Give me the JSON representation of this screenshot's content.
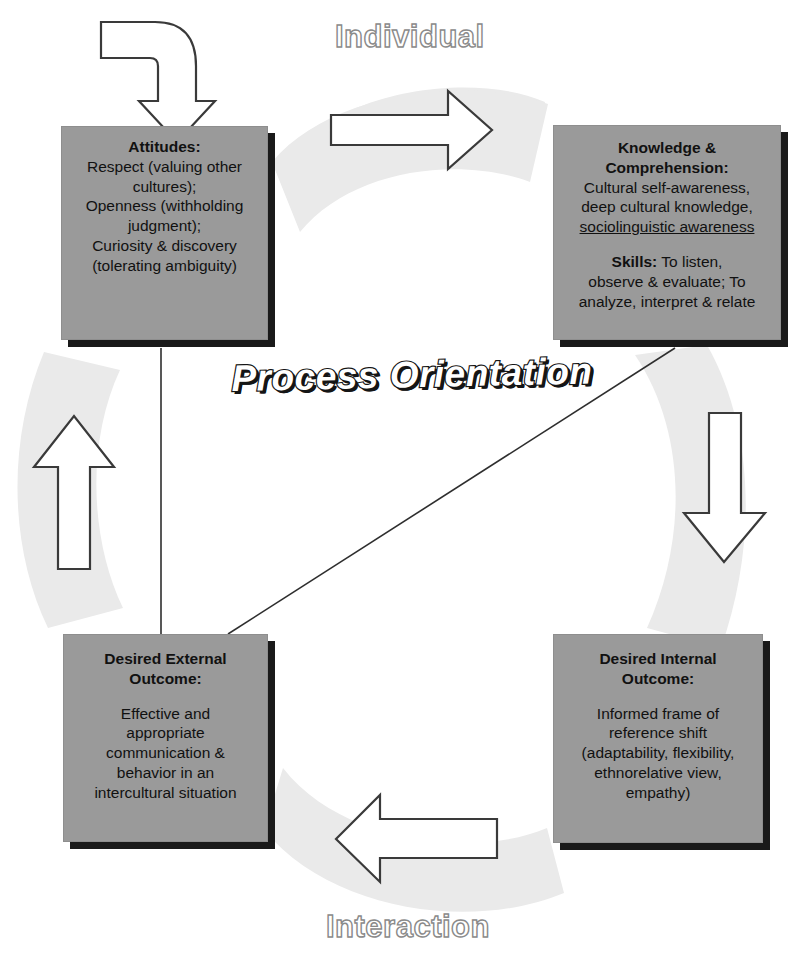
{
  "diagram": {
    "title": "Process Orientation",
    "cycle_labels": {
      "top": "Individual",
      "bottom": "Interaction"
    },
    "colors": {
      "box_fill": "#9a9a9a",
      "box_shadow": "#1a1a1a",
      "band_fill": "#eaeaea",
      "arrow_fill": "#ffffff",
      "arrow_stroke": "#3a3a3a",
      "text": "#111111",
      "title_fill": "#ffffff",
      "title_outline": "#151515",
      "label_outline": "#8a8a8a",
      "background": "#ffffff"
    },
    "nodes": [
      {
        "id": "attitudes",
        "position": "top-left",
        "lines": [
          {
            "text": "Attitudes:",
            "bold": true
          },
          {
            "text": "Respect (valuing other"
          },
          {
            "text": "cultures);"
          },
          {
            "text": "Openness (withholding"
          },
          {
            "text": "judgment);"
          },
          {
            "text": "Curiosity & discovery"
          },
          {
            "text": "(tolerating ambiguity)"
          }
        ]
      },
      {
        "id": "knowledge",
        "position": "top-right",
        "lines": [
          {
            "text": "Knowledge &",
            "bold": true
          },
          {
            "text": "Comprehension:",
            "bold": true
          },
          {
            "text": "Cultural self-awareness,"
          },
          {
            "text": "deep cultural knowledge,"
          },
          {
            "text": "sociolinguistic awareness",
            "underline": true
          },
          {
            "text": "",
            "gap": true
          },
          {
            "text": "Skills: To listen,",
            "bold_prefix": "Skills:",
            "rest": " To listen,"
          },
          {
            "text": "observe & evaluate; To"
          },
          {
            "text": "analyze, interpret & relate"
          }
        ]
      },
      {
        "id": "external",
        "position": "bottom-left",
        "lines": [
          {
            "text": "Desired External",
            "bold": true
          },
          {
            "text": "Outcome:",
            "bold": true
          },
          {
            "text": "",
            "gap": true
          },
          {
            "text": "Effective and"
          },
          {
            "text": "appropriate"
          },
          {
            "text": "communication &"
          },
          {
            "text": "behavior in an"
          },
          {
            "text": "intercultural situation"
          }
        ]
      },
      {
        "id": "internal",
        "position": "bottom-right",
        "lines": [
          {
            "text": "Desired Internal",
            "bold": true
          },
          {
            "text": "Outcome:",
            "bold": true
          },
          {
            "text": "",
            "gap": true
          },
          {
            "text": "Informed frame of"
          },
          {
            "text": "reference shift"
          },
          {
            "text": "(adaptability, flexibility,"
          },
          {
            "text": "ethnorelative view,"
          },
          {
            "text": "empathy)"
          }
        ]
      }
    ],
    "arrows": [
      {
        "id": "entry-arrow",
        "shape": "bent-down",
        "from": "outside",
        "to": "attitudes"
      },
      {
        "id": "arrow-top",
        "direction": "right",
        "from": "attitudes",
        "to": "knowledge",
        "band_label": "Individual"
      },
      {
        "id": "arrow-right",
        "direction": "down",
        "from": "knowledge",
        "to": "internal"
      },
      {
        "id": "arrow-bottom",
        "direction": "left",
        "from": "internal",
        "to": "external",
        "band_label": "Interaction"
      },
      {
        "id": "arrow-left",
        "direction": "up",
        "from": "external",
        "to": "attitudes"
      }
    ],
    "connectors": [
      {
        "id": "connector-vertical",
        "from": "attitudes",
        "to": "external"
      },
      {
        "id": "connector-diagonal",
        "from": "knowledge",
        "to": "external"
      }
    ]
  }
}
